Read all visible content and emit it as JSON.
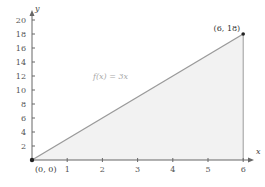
{
  "chart_data": {
    "type": "area",
    "title": "",
    "xlabel": "x",
    "ylabel": "y",
    "xlim": [
      0,
      6.4
    ],
    "ylim": [
      0,
      21
    ],
    "x_ticks": [
      1,
      2,
      3,
      4,
      5,
      6
    ],
    "y_ticks": [
      2,
      4,
      6,
      8,
      10,
      12,
      14,
      16,
      18,
      20
    ],
    "grid": false,
    "series": [
      {
        "name": "f(x) = 3x",
        "x": [
          0,
          6
        ],
        "values": [
          0,
          18
        ]
      }
    ],
    "shaded_region": {
      "from_x": 0,
      "to_x": 6,
      "under": "f(x) = 3x"
    },
    "annotations": [
      {
        "text": "(0, 0)",
        "x": 0,
        "y": 0
      },
      {
        "text": "(6, 18)",
        "x": 6,
        "y": 18
      },
      {
        "text": "f(x) = 3x",
        "x": 2.5,
        "y": 11.5
      }
    ]
  },
  "labels": {
    "x_axis": "x",
    "y_axis": "y",
    "function": "f(x) = 3x",
    "origin": "(0, 0)",
    "endpoint": "(6, 18)"
  },
  "colors": {
    "fill": "#f2f2f2",
    "line": "#9a9a9a",
    "axis": "#666666",
    "point": "#222222"
  }
}
